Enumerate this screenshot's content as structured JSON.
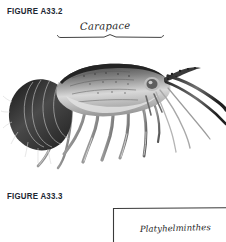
{
  "page": {
    "background_color": "#ffffff",
    "width": 226,
    "height": 242
  },
  "figures": [
    {
      "id": "figure-a33-2",
      "label": "FIGURE A33.2",
      "label_color": "#1d2733",
      "subject": "spiny-lobster-photograph",
      "annotations": [
        {
          "name": "carapace",
          "text": "Carapace",
          "style": "handwritten",
          "ink_color": "#262626",
          "has_bracket": true,
          "bracket_span_px": [
            57,
            163
          ],
          "bracket_y_px": 37
        }
      ]
    },
    {
      "id": "figure-a33-3",
      "label": "FIGURE A33.3",
      "label_color": "#1d2733",
      "subject": "cladogram",
      "annotations": [
        {
          "name": "platyhelminthes",
          "text": "Platyhelminthes",
          "style": "handwritten",
          "ink_color": "#262626",
          "has_bracket": false
        }
      ]
    }
  ],
  "icons": {
    "lobster": "spiny-lobster-icon",
    "cladogram": "cladogram-branch-icon"
  }
}
